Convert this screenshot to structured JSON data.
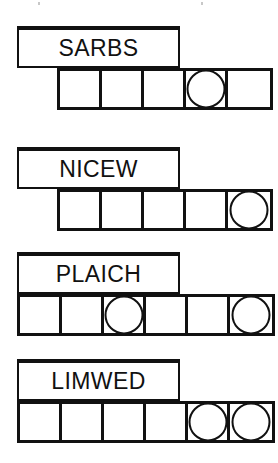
{
  "page": {
    "background_color": "#ffffff",
    "ink_color": "#111111"
  },
  "puzzle": {
    "type": "word-unscramble",
    "row_count": 4,
    "rows": [
      {
        "id": "row-1",
        "word": "SARBS",
        "label_box": {
          "x": 17,
          "y": 26,
          "width": 163,
          "height": 42
        },
        "grid": {
          "x": 57,
          "y": 68,
          "cell_count": 5,
          "cell_width": 42,
          "height": 42
        },
        "circled_cells": [
          4
        ]
      },
      {
        "id": "row-2",
        "word": "NICEW",
        "label_box": {
          "x": 17,
          "y": 147,
          "width": 163,
          "height": 42
        },
        "grid": {
          "x": 57,
          "y": 189,
          "cell_count": 5,
          "cell_width": 42,
          "height": 42
        },
        "circled_cells": [
          5
        ]
      },
      {
        "id": "row-3",
        "word": "PLAICH",
        "label_box": {
          "x": 17,
          "y": 252,
          "width": 163,
          "height": 42
        },
        "grid": {
          "x": 17,
          "y": 294,
          "cell_count": 6,
          "cell_width": 42,
          "height": 42
        },
        "circled_cells": [
          3,
          6
        ]
      },
      {
        "id": "row-4",
        "word": "LIMWED",
        "label_box": {
          "x": 17,
          "y": 359,
          "width": 163,
          "height": 42
        },
        "grid": {
          "x": 17,
          "y": 401,
          "cell_count": 6,
          "cell_width": 42,
          "height": 42
        },
        "circled_cells": [
          5,
          6
        ]
      }
    ]
  }
}
